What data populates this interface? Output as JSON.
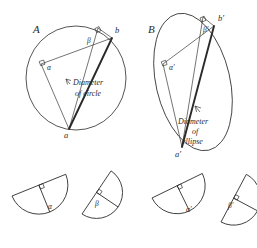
{
  "figure": {
    "title_visible": false,
    "background_color": "#ffffff",
    "ink_color": "#2b2a28",
    "panels": [
      {
        "id": "A",
        "label": "A",
        "shape": "circle",
        "caption_lines": [
          "Diameter",
          "of circle"
        ],
        "vertices": [
          {
            "name": "a",
            "label": "a"
          },
          {
            "name": "b",
            "label": "b"
          }
        ],
        "angles": [
          {
            "name": "alpha",
            "label": "α"
          },
          {
            "name": "beta",
            "label": "β"
          }
        ],
        "right_angle_marks": 2
      },
      {
        "id": "B",
        "label": "B",
        "shape": "ellipse",
        "caption_lines": [
          "Diameter",
          "of",
          "ellipse"
        ],
        "vertices": [
          {
            "name": "a-prime",
            "label": "a'"
          },
          {
            "name": "b-prime",
            "label": "b'"
          }
        ],
        "angles": [
          {
            "name": "alpha-prime",
            "label": "α'"
          },
          {
            "name": "beta-prime",
            "label": "β'"
          }
        ],
        "right_angle_marks": 2
      }
    ],
    "sectors": [
      {
        "name": "sector-alpha",
        "label": "α",
        "panel": "A"
      },
      {
        "name": "sector-beta",
        "label": "β",
        "panel": "A"
      },
      {
        "name": "sector-alpha-prime",
        "label": "α'",
        "panel": "B"
      },
      {
        "name": "sector-beta-prime",
        "label": "β'",
        "panel": "B"
      }
    ]
  }
}
